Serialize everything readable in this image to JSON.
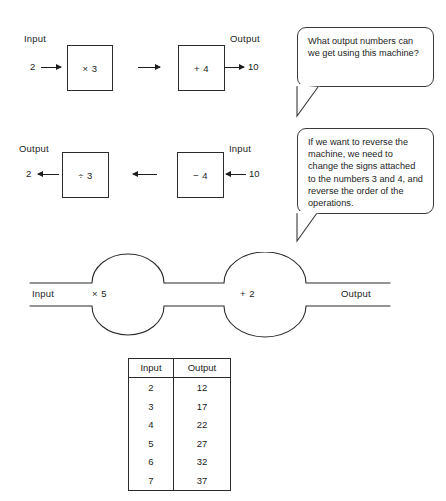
{
  "forward_machine": {
    "input_label": "Input",
    "output_label": "Output",
    "input_value": "2",
    "output_value": "10",
    "op1": "× 3",
    "op2": "+ 4"
  },
  "reverse_machine": {
    "output_label": "Output",
    "input_label": "Input",
    "output_value": "2",
    "input_value": "10",
    "op1": "÷ 3",
    "op2": "− 4"
  },
  "bubbles": [
    {
      "text": "What output numbers can we get using this machine?"
    },
    {
      "text": "If we want to reverse the machine, we need to change the signs attached to the numbers 3 and 4, and reverse the order of the operations."
    }
  ],
  "pipeline": {
    "input_label": "Input",
    "output_label": "Output",
    "op1": "× 5",
    "op2": "+ 2"
  },
  "table": {
    "headers": [
      "Input",
      "Output"
    ],
    "rows": [
      [
        "2",
        "12"
      ],
      [
        "3",
        "17"
      ],
      [
        "4",
        "22"
      ],
      [
        "5",
        "27"
      ],
      [
        "6",
        "32"
      ],
      [
        "7",
        "37"
      ]
    ]
  }
}
